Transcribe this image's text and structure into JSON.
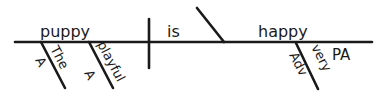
{
  "diagram": {
    "type": "sentence-diagram",
    "sentence": "The playful puppy is very happy",
    "subject": {
      "word": "puppy"
    },
    "verb": {
      "word": "is"
    },
    "complement": {
      "word": "happy",
      "tag": "PA"
    },
    "modifiers": [
      {
        "word": "The",
        "tag": "A",
        "modifies": "puppy"
      },
      {
        "word": "playful",
        "tag": "A",
        "modifies": "puppy"
      },
      {
        "word": "very",
        "tag": "Adv",
        "modifies": "happy"
      }
    ],
    "colors": {
      "ink": "#1a1a1a",
      "background": "#ffffff"
    }
  }
}
